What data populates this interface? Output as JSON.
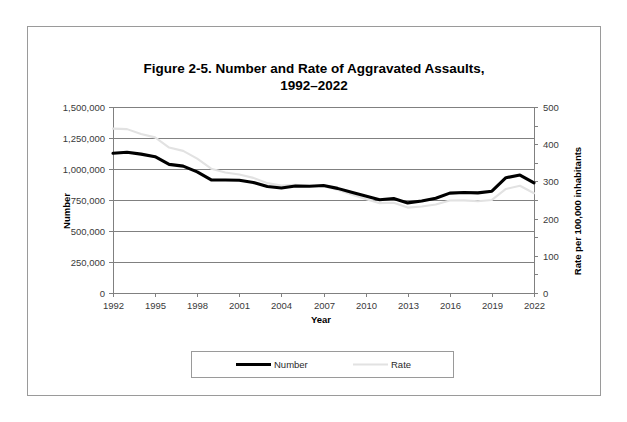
{
  "figure": {
    "title_line1": "Figure 2-5. Number and Rate of Aggravated Assaults,",
    "title_line2": "1992–2022"
  },
  "chart_data": {
    "type": "line",
    "title": "Figure 2-5. Number and Rate of Aggravated Assaults, 1992–2022",
    "xlabel": "Year",
    "ylabel": "Number",
    "y2label": "Rate per 100,000 inhabitants",
    "grid": true,
    "legend_position": "bottom",
    "xlim": [
      1992,
      2022
    ],
    "ylim": [
      0,
      1500000
    ],
    "y2lim": [
      0,
      500
    ],
    "x": [
      1992,
      1993,
      1994,
      1995,
      1996,
      1997,
      1998,
      1999,
      2000,
      2001,
      2002,
      2003,
      2004,
      2005,
      2006,
      2007,
      2008,
      2009,
      2010,
      2011,
      2012,
      2013,
      2014,
      2015,
      2016,
      2017,
      2018,
      2019,
      2020,
      2021,
      2022
    ],
    "xticks": [
      1992,
      1995,
      1998,
      2001,
      2004,
      2007,
      2010,
      2013,
      2016,
      2019,
      2022
    ],
    "xticklabels": [
      "1992",
      "1995",
      "1998",
      "2001",
      "2004",
      "2007",
      "2010",
      "2013",
      "2016",
      "2019",
      "2022"
    ],
    "yticks": [
      0,
      250000,
      500000,
      750000,
      1000000,
      1250000,
      1500000
    ],
    "yticklabels": [
      "0",
      "250,000",
      "500,000",
      "750,000",
      "1,000,000",
      "1,250,000",
      "1,500,000"
    ],
    "y2ticks": [
      0,
      100,
      200,
      300,
      400,
      500
    ],
    "y2ticklabels": [
      "0",
      "100",
      "200",
      "300",
      "400",
      "500"
    ],
    "y2minorticks": [
      50,
      150,
      250,
      350,
      450
    ],
    "series": [
      {
        "name": "Number",
        "axis": "left",
        "color": "#000000",
        "values": [
          1126974,
          1135607,
          1119950,
          1099207,
          1037049,
          1023201,
          976583,
          911740,
          911706,
          909023,
          891407,
          859030,
          847381,
          862220,
          860853,
          866358,
          843683,
          812514,
          781844,
          752423,
          762009,
          726575,
          741291,
          764057,
          805775,
          810825,
          807410,
          821182,
          929736,
          951238,
          888609
        ]
      },
      {
        "name": "Rate",
        "axis": "right",
        "color": "#e2e2e2",
        "values": [
          441.8,
          440.5,
          427.6,
          418.3,
          391.0,
          382.1,
          361.4,
          334.3,
          324.0,
          318.6,
          309.5,
          295.4,
          288.6,
          290.8,
          287.5,
          287.2,
          277.5,
          264.7,
          252.8,
          241.5,
          242.8,
          229.6,
          232.5,
          237.8,
          248.5,
          248.9,
          246.8,
          250.2,
          279.7,
          288.2,
          268.2
        ]
      }
    ]
  },
  "legend": {
    "items": [
      {
        "label": "Number"
      },
      {
        "label": "Rate"
      }
    ]
  },
  "colors": {
    "number_series": "#000000",
    "rate_series": "#e2e2e2",
    "gridline": "#808080",
    "frame": "#9a9a9a"
  }
}
